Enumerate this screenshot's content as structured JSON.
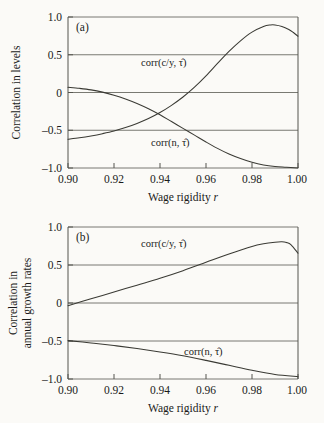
{
  "figure": {
    "background_color": "#fbfaf7",
    "curve_color": "#3a3a34",
    "axis_color": "#55554e"
  },
  "panel_a": {
    "tag": "(a)",
    "ylabel": "Correlation in levels",
    "xlabel_text": "Wage rigidity ",
    "xlabel_italic": "r",
    "ytick_labels": [
      "1.0",
      "0.5",
      "0",
      "–0.5",
      "–1.0"
    ],
    "xtick_labels": [
      "0.90",
      "0.92",
      "0.94",
      "0.96",
      "0.98",
      "1.00"
    ],
    "label_cy": "corr(c/y, τ̂)",
    "label_n": "corr(n, τ̂)"
  },
  "panel_b": {
    "tag": "(b)",
    "ylabel_line1": "Correlation in",
    "ylabel_line2": "annual growth rates",
    "xlabel_text": "Wage rigidity ",
    "xlabel_italic": "r",
    "ytick_labels": [
      "1.0",
      "0.5",
      "0",
      "–0.5",
      "–1.0"
    ],
    "xtick_labels": [
      "0.90",
      "0.92",
      "0.94",
      "0.96",
      "0.98",
      "1.00"
    ],
    "label_cy": "corr(c/y, τ̂)",
    "label_n": "corr(n, τ̂)"
  },
  "chart_data": [
    {
      "type": "line",
      "id": "panel_a",
      "title": "(a)",
      "xlabel": "Wage rigidity r",
      "ylabel": "Correlation in levels",
      "xlim": [
        0.9,
        1.0
      ],
      "ylim": [
        -1.0,
        1.0
      ],
      "xticks": [
        0.9,
        0.92,
        0.94,
        0.96,
        0.98,
        1.0
      ],
      "yticks": [
        -1.0,
        -0.5,
        0,
        0.5,
        1.0
      ],
      "grid": true,
      "legend": "inline-annotations",
      "series": [
        {
          "name": "corr(c/y, tau-hat)",
          "x": [
            0.9,
            0.905,
            0.91,
            0.915,
            0.92,
            0.925,
            0.93,
            0.935,
            0.94,
            0.945,
            0.95,
            0.955,
            0.96,
            0.965,
            0.97,
            0.975,
            0.98,
            0.985,
            0.988,
            0.99,
            0.993,
            0.996,
            0.998,
            1.0
          ],
          "y": [
            -0.62,
            -0.6,
            -0.575,
            -0.545,
            -0.51,
            -0.465,
            -0.41,
            -0.345,
            -0.265,
            -0.17,
            -0.06,
            0.07,
            0.22,
            0.385,
            0.545,
            0.685,
            0.8,
            0.875,
            0.895,
            0.895,
            0.875,
            0.835,
            0.795,
            0.745
          ]
        },
        {
          "name": "corr(n, tau-hat)",
          "x": [
            0.9,
            0.905,
            0.91,
            0.915,
            0.92,
            0.925,
            0.93,
            0.935,
            0.94,
            0.945,
            0.95,
            0.955,
            0.96,
            0.965,
            0.97,
            0.975,
            0.98,
            0.985,
            0.99,
            0.995,
            1.0
          ],
          "y": [
            0.07,
            0.055,
            0.035,
            0.005,
            -0.035,
            -0.085,
            -0.145,
            -0.215,
            -0.295,
            -0.385,
            -0.475,
            -0.565,
            -0.655,
            -0.74,
            -0.815,
            -0.875,
            -0.925,
            -0.96,
            -0.98,
            -0.99,
            -1.0
          ]
        }
      ]
    },
    {
      "type": "line",
      "id": "panel_b",
      "title": "(b)",
      "xlabel": "Wage rigidity r",
      "ylabel": "Correlation in annual growth rates",
      "xlim": [
        0.9,
        1.0
      ],
      "ylim": [
        -1.0,
        1.0
      ],
      "xticks": [
        0.9,
        0.92,
        0.94,
        0.96,
        0.98,
        1.0
      ],
      "yticks": [
        -1.0,
        -0.5,
        0,
        0.5,
        1.0
      ],
      "grid": true,
      "legend": "inline-annotations",
      "series": [
        {
          "name": "corr(c/y, tau-hat)",
          "x": [
            0.9,
            0.91,
            0.92,
            0.93,
            0.94,
            0.95,
            0.96,
            0.97,
            0.98,
            0.985,
            0.99,
            0.993,
            0.995,
            0.997,
            1.0
          ],
          "y": [
            -0.035,
            0.055,
            0.145,
            0.235,
            0.325,
            0.425,
            0.535,
            0.645,
            0.745,
            0.78,
            0.8,
            0.805,
            0.795,
            0.765,
            0.655
          ]
        },
        {
          "name": "corr(n, tau-hat)",
          "x": [
            0.9,
            0.91,
            0.92,
            0.93,
            0.94,
            0.95,
            0.96,
            0.97,
            0.98,
            0.99,
            1.0
          ],
          "y": [
            -0.495,
            -0.525,
            -0.56,
            -0.6,
            -0.645,
            -0.695,
            -0.755,
            -0.82,
            -0.885,
            -0.94,
            -0.97
          ]
        }
      ]
    }
  ]
}
